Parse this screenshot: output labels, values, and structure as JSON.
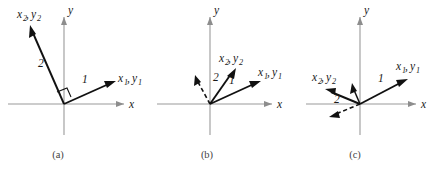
{
  "figure": {
    "background_color": "#ffffff",
    "axis_color": "#9a9a9a",
    "vector_color": "#111111",
    "label_color": "#1a1a1a",
    "caption_color": "#444444",
    "width": 442,
    "height": 177
  },
  "panels": [
    {
      "id": "a",
      "caption": "(a)",
      "origin_x": 64,
      "origin_y": 104,
      "axes": {
        "x_label": "x",
        "y_label": "y"
      },
      "vectors": [
        {
          "name": "x1y1",
          "label_main": "x",
          "label_sub": "1",
          "label_main2": "y",
          "label_sub2": "1",
          "label_full": "x_1, y_1",
          "magnitude_label": "1",
          "style": "solid"
        },
        {
          "name": "x2y2",
          "label_main": "x",
          "label_sub": "2",
          "label_main2": "y",
          "label_sub2": "2",
          "label_full": "x_2, y_2",
          "magnitude_label": "2",
          "style": "solid"
        }
      ],
      "right_angle_marker": true
    },
    {
      "id": "b",
      "caption": "(b)",
      "origin_x": 210,
      "origin_y": 104,
      "axes": {
        "x_label": "x",
        "y_label": "y"
      },
      "vectors": [
        {
          "name": "x1y1",
          "label_main": "x",
          "label_sub": "1",
          "label_main2": "y",
          "label_sub2": "1",
          "label_full": "x_1, y_1",
          "magnitude_label": "1",
          "style": "solid"
        },
        {
          "name": "x2y2",
          "label_main": "x",
          "label_sub": "2",
          "label_main2": "y",
          "label_sub2": "2",
          "label_full": "x_2, y_2",
          "magnitude_label": "2",
          "style": "solid"
        },
        {
          "name": "reference-dashed",
          "label_full": "",
          "magnitude_label": "",
          "style": "dashed"
        }
      ],
      "right_angle_marker": false
    },
    {
      "id": "c",
      "caption": "(c)",
      "origin_x": 360,
      "origin_y": 104,
      "axes": {
        "x_label": "x",
        "y_label": "y"
      },
      "vectors": [
        {
          "name": "x1y1",
          "label_main": "x",
          "label_sub": "1",
          "label_main2": "y",
          "label_sub2": "1",
          "label_full": "x_1, y_1",
          "magnitude_label": "1",
          "style": "solid"
        },
        {
          "name": "x2y2",
          "label_main": "x",
          "label_sub": "2",
          "label_main2": "y",
          "label_sub2": "2",
          "label_full": "x_2, y_2",
          "magnitude_label": "2",
          "style": "solid"
        },
        {
          "name": "reference-dashed",
          "label_full": "",
          "magnitude_label": "",
          "style": "dashed"
        },
        {
          "name": "short-solid",
          "label_full": "",
          "magnitude_label": "",
          "style": "solid"
        }
      ],
      "right_angle_marker": false
    }
  ],
  "labels": {
    "x_axis": "x",
    "y_axis": "y",
    "var_x": "x",
    "var_y": "y",
    "sub_1": "1",
    "sub_2": "2",
    "comma": ",",
    "mag_1": "1",
    "mag_2": "2",
    "caption_a": "(a)",
    "caption_b": "(b)",
    "caption_c": "(c)"
  }
}
